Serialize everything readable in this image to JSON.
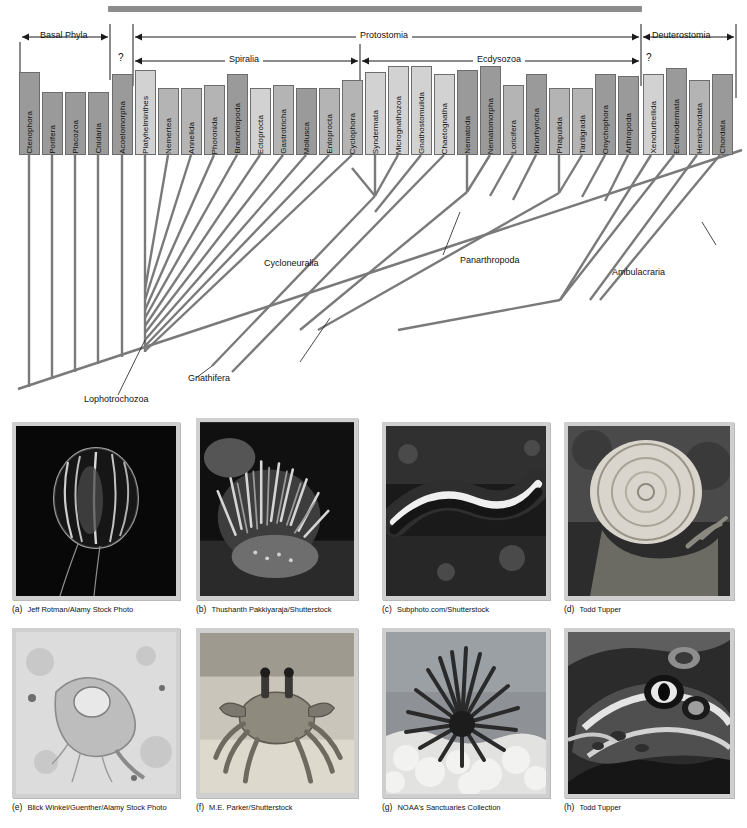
{
  "figure": {
    "type": "phylogenetic-tree",
    "title_bar_color": "#8c8c8c"
  },
  "tree": {
    "uncertainty_marks": [
      "?",
      "?"
    ],
    "clade_brackets": [
      {
        "label": "Basal Phyla",
        "arrows": "both"
      },
      {
        "label": "Protostomia",
        "arrows": "both"
      },
      {
        "label": "Spiralia",
        "arrows": "both"
      },
      {
        "label": "Ecdysozoa",
        "arrows": "both"
      },
      {
        "label": "Deuterostomia",
        "arrows": "both"
      }
    ],
    "internal_labels": [
      {
        "label": "Lophotrochozoa"
      },
      {
        "label": "Gnathifera"
      },
      {
        "label": "Cycloneuralia"
      },
      {
        "label": "Panarthropoda"
      },
      {
        "label": "Ambulacraria"
      }
    ],
    "taxa": [
      {
        "name": "Ctenophora",
        "shade": "dark"
      },
      {
        "name": "Porifera",
        "shade": "dark"
      },
      {
        "name": "Placozoa",
        "shade": "dark"
      },
      {
        "name": "Cnidaria",
        "shade": "dark"
      },
      {
        "name": "Acoelomorpha",
        "shade": "dark"
      },
      {
        "name": "Platyhelminthes",
        "shade": "light"
      },
      {
        "name": "Nemertea",
        "shade": "mid"
      },
      {
        "name": "Annelida",
        "shade": "mid"
      },
      {
        "name": "Phoronida",
        "shade": "mid"
      },
      {
        "name": "Branchiopoda",
        "shade": "dark"
      },
      {
        "name": "Ectoprocta",
        "shade": "light"
      },
      {
        "name": "Gastrotricha",
        "shade": "mid"
      },
      {
        "name": "Mollusca",
        "shade": "dark"
      },
      {
        "name": "Entoprocta",
        "shade": "mid"
      },
      {
        "name": "Cyclophora",
        "shade": "mid"
      },
      {
        "name": "Syndermata",
        "shade": "light"
      },
      {
        "name": "Micrognathozoa",
        "shade": "light"
      },
      {
        "name": "Gnathostomulida",
        "shade": "light"
      },
      {
        "name": "Chaetognatha",
        "shade": "light"
      },
      {
        "name": "Nematoda",
        "shade": "dark"
      },
      {
        "name": "Nematomorpha",
        "shade": "dark"
      },
      {
        "name": "Loricifera",
        "shade": "mid"
      },
      {
        "name": "Kinorhyncha",
        "shade": "dark"
      },
      {
        "name": "Priapulida",
        "shade": "mid"
      },
      {
        "name": "Tardigrada",
        "shade": "mid"
      },
      {
        "name": "Onychophora",
        "shade": "dark"
      },
      {
        "name": "Arthropoda",
        "shade": "dark"
      },
      {
        "name": "Xenoturbellida",
        "shade": "light"
      },
      {
        "name": "Echinodermata",
        "shade": "dark"
      },
      {
        "name": "Hemichordata",
        "shade": "mid"
      },
      {
        "name": "Chordata",
        "shade": "dark"
      }
    ]
  },
  "photos": [
    {
      "letter": "(a)",
      "credit": "Jeff Rotman/Alamy Stock Photo",
      "subject": "ctenophore"
    },
    {
      "letter": "(b)",
      "credit": "Thushanth Pakkiyaraja/Shutterstock",
      "subject": "sea-anemone"
    },
    {
      "letter": "(c)",
      "credit": "Subphoto.com/Shutterstock",
      "subject": "flatworm"
    },
    {
      "letter": "(d)",
      "credit": "Todd Tupper",
      "subject": "snail"
    },
    {
      "letter": "(e)",
      "credit": "Blick Winkel/Guenther/Alamy Stock Photo",
      "subject": "rotifer"
    },
    {
      "letter": "(f)",
      "credit": "M.E. Parker/Shutterstock",
      "subject": "ghost-crab"
    },
    {
      "letter": "(g)",
      "credit": "NOAA's Sanctuaries Collection",
      "subject": "sea-urchin"
    },
    {
      "letter": "(h)",
      "credit": "Todd Tupper",
      "subject": "leopard-frog"
    }
  ]
}
